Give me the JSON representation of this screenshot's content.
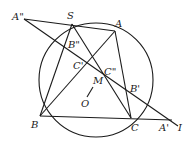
{
  "diagram": {
    "type": "geometry-circle-construction",
    "labels": {
      "A2": "A\"",
      "S": "S",
      "A": "A",
      "B2": "B\"",
      "C1": "C'",
      "C2": "C\"",
      "M": "M",
      "O": "O",
      "B1": "B'",
      "B": "B",
      "C": "C",
      "A1": "A'",
      "I": "I"
    },
    "points": [
      "A\"",
      "S",
      "A",
      "B\"",
      "C'",
      "C\"",
      "M",
      "O",
      "B'",
      "B",
      "C",
      "A'",
      "I"
    ],
    "segments": [
      [
        "A\"",
        "I"
      ],
      [
        "A\"",
        "A"
      ],
      [
        "S",
        "B"
      ],
      [
        "S",
        "C"
      ],
      [
        "A",
        "B"
      ],
      [
        "A",
        "C"
      ],
      [
        "B",
        "I"
      ],
      [
        "O",
        "M"
      ]
    ],
    "circle": "circumcircle through S, A, B, C"
  }
}
